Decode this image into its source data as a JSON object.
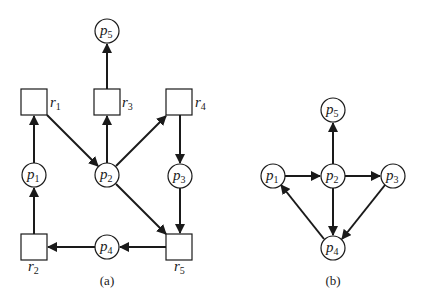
{
  "diagrams": [
    {
      "id": "a",
      "caption": "(a)",
      "type": "resource-allocation-graph",
      "processes": [
        {
          "id": "p1",
          "letter": "p",
          "sub": "1"
        },
        {
          "id": "p2",
          "letter": "p",
          "sub": "2"
        },
        {
          "id": "p3",
          "letter": "p",
          "sub": "3"
        },
        {
          "id": "p4",
          "letter": "p",
          "sub": "4"
        },
        {
          "id": "p5",
          "letter": "p",
          "sub": "5"
        }
      ],
      "resources": [
        {
          "id": "r1",
          "letter": "r",
          "sub": "1"
        },
        {
          "id": "r2",
          "letter": "r",
          "sub": "2"
        },
        {
          "id": "r3",
          "letter": "r",
          "sub": "3"
        },
        {
          "id": "r4",
          "letter": "r",
          "sub": "4"
        },
        {
          "id": "r5",
          "letter": "r",
          "sub": "5"
        }
      ],
      "edges": [
        {
          "from": "r3",
          "to": "p5"
        },
        {
          "from": "p1",
          "to": "r1"
        },
        {
          "from": "r1",
          "to": "p2"
        },
        {
          "from": "p2",
          "to": "r3"
        },
        {
          "from": "p2",
          "to": "r4"
        },
        {
          "from": "p2",
          "to": "r5"
        },
        {
          "from": "r4",
          "to": "p3"
        },
        {
          "from": "p3",
          "to": "r5"
        },
        {
          "from": "r5",
          "to": "p4"
        },
        {
          "from": "p4",
          "to": "r2"
        },
        {
          "from": "r2",
          "to": "p1"
        }
      ]
    },
    {
      "id": "b",
      "caption": "(b)",
      "type": "wait-for-graph",
      "processes": [
        {
          "id": "p1",
          "letter": "p",
          "sub": "1"
        },
        {
          "id": "p2",
          "letter": "p",
          "sub": "2"
        },
        {
          "id": "p3",
          "letter": "p",
          "sub": "3"
        },
        {
          "id": "p4",
          "letter": "p",
          "sub": "4"
        },
        {
          "id": "p5",
          "letter": "p",
          "sub": "5"
        }
      ],
      "edges": [
        {
          "from": "p1",
          "to": "p2"
        },
        {
          "from": "p2",
          "to": "p5"
        },
        {
          "from": "p2",
          "to": "p3"
        },
        {
          "from": "p2",
          "to": "p4"
        },
        {
          "from": "p3",
          "to": "p4"
        },
        {
          "from": "p4",
          "to": "p1"
        }
      ]
    }
  ]
}
